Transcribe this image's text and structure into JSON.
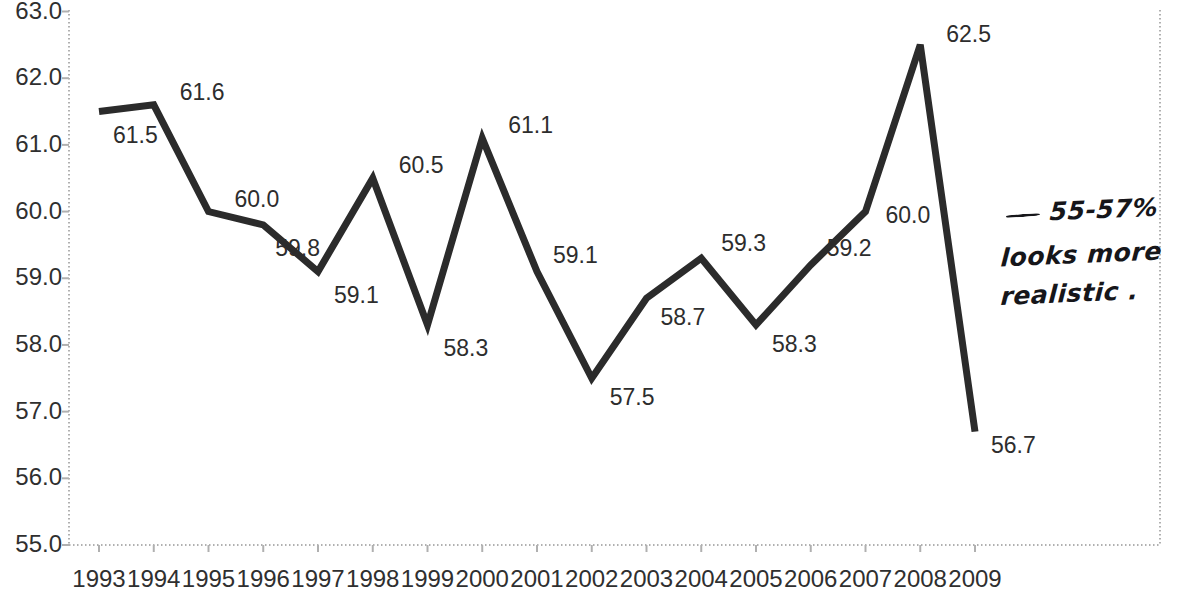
{
  "chart_data": {
    "type": "line",
    "title": "",
    "subtitle": "",
    "xlabel": "",
    "ylabel": "",
    "categories": [
      "1993",
      "1994",
      "1995",
      "1996",
      "1997",
      "1998",
      "1999",
      "2000",
      "2001",
      "2002",
      "2003",
      "2004",
      "2005",
      "2006",
      "2007",
      "2008",
      "2009"
    ],
    "values": [
      61.5,
      61.6,
      60.0,
      59.8,
      59.1,
      60.5,
      58.3,
      61.1,
      59.1,
      57.5,
      58.7,
      59.3,
      58.3,
      59.2,
      60.0,
      62.5,
      56.7
    ],
    "series": [
      {
        "name": "",
        "values": [
          61.5,
          61.6,
          60.0,
          59.8,
          59.1,
          60.5,
          58.3,
          61.1,
          59.1,
          57.5,
          58.7,
          59.3,
          58.3,
          59.2,
          60.0,
          62.5,
          56.7
        ]
      }
    ],
    "data_labels": [
      "61.5",
      "61.6",
      "60.0",
      "59.8",
      "59.1",
      "60.5",
      "58.3",
      "61.1",
      "59.1",
      "57.5",
      "58.7",
      "59.3",
      "58.3",
      "59.2",
      "60.0",
      "62.5",
      "56.7"
    ],
    "ylim": [
      55.0,
      63.0
    ],
    "ytick_values": [
      63.0,
      62.0,
      61.0,
      60.0,
      59.0,
      58.0,
      57.0,
      56.0,
      55.0
    ],
    "ytick_labels": [
      "63.0",
      "62.0",
      "61.0",
      "60.0",
      "59.0",
      "58.0",
      "57.0",
      "56.0",
      "55.0"
    ],
    "xtick_labels": [
      "1993",
      "1994",
      "1995",
      "1996",
      "1997",
      "1998",
      "1999",
      "2000",
      "2001",
      "2002",
      "2003",
      "2004",
      "2005",
      "2006",
      "2007",
      "2008",
      "2009"
    ],
    "grid": false,
    "legend": "none",
    "line_color": "#2b2b2b",
    "axis_color": "#b8b8b8",
    "text_color": "#2f2f2f",
    "annotation_color": "#16161a"
  },
  "annotation": {
    "line1": "55-57%",
    "line2": "looks more",
    "line3": "realistic ."
  }
}
